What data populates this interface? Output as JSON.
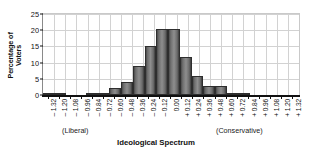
{
  "chart_data": {
    "type": "bar",
    "title": "",
    "xlabel": "Ideological Spectrum",
    "ylabel": "Percentage of Voters",
    "ylabel_lines": [
      "Percentage of",
      "Voters"
    ],
    "categories": [
      "– 1.32",
      "– 1.20",
      "– 1.08",
      "– 0.96",
      "– 0.84",
      "– 0.72",
      "– 0.60",
      "– 0.48",
      "– 0.36",
      "– 0.24",
      "– 0.12",
      "0.00",
      "+ 0.12",
      "+ 0.24",
      "+ 0.36",
      "+ 0.48",
      "+ 0.60",
      "+ 0.72",
      "+ 0.84",
      "+ 0.96",
      "+ 1.08",
      "+ 1.20",
      "+ 1.32"
    ],
    "values": [
      0.3,
      0.3,
      0.0,
      0.0,
      0.3,
      0.5,
      2.2,
      4.1,
      9.1,
      15.1,
      20.5,
      20.5,
      11.6,
      6.0,
      2.9,
      2.9,
      0.6,
      0.3,
      0.0,
      0.0,
      0.0,
      0.0,
      0.0
    ],
    "yticks": [
      0,
      5,
      10,
      15,
      20,
      25
    ],
    "ylim": [
      0,
      25
    ],
    "xlim_labels": [
      "– 1.32",
      "+ 1.32"
    ],
    "grid": true,
    "legend": "none",
    "annotations": {
      "left_anchor": "(Liberal)",
      "right_anchor": "(Conservative)"
    },
    "colors": {
      "bar_fill_light": "#8e8e8e",
      "bar_fill_dark": "#3c3c3c",
      "bar_edge": "#2e2e2e",
      "grid": "#d2d2d2",
      "axis": "#111111",
      "background": "#ffffff",
      "text": "#111111"
    }
  }
}
